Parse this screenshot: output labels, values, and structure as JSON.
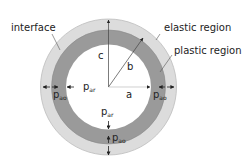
{
  "diagram": {
    "type": "concentric-cylinder-cross-section",
    "center": {
      "x": 108.5,
      "y": 87
    },
    "colors": {
      "background": "#ffffff",
      "elastic_region": "#dcdcdc",
      "plastic_region": "#9a9a9a",
      "core": "#ffffff",
      "lines": "#333333",
      "text": "#222222"
    },
    "radii": {
      "outer": 68,
      "plastic_outer": 57,
      "inner": 42.5
    },
    "region_labels": {
      "interface": "interface",
      "elastic": "elastic region",
      "plastic": "plastic region"
    },
    "radius_labels": {
      "a": "a",
      "b": "b",
      "c": "c"
    },
    "pressure_labels": {
      "inner_left": {
        "base": "p",
        "sub": "ar"
      },
      "inner_bottom": {
        "base": "p",
        "sub": "ar"
      },
      "interface_left": {
        "base": "p",
        "sub": "ao"
      },
      "interface_right": {
        "base": "p",
        "sub": "ao"
      },
      "interface_bottom": {
        "base": "p",
        "sub": "ao"
      }
    }
  }
}
